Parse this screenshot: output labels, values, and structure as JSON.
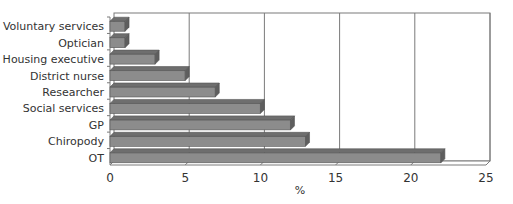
{
  "chart_data": {
    "type": "bar",
    "orientation": "horizontal",
    "style": "3d",
    "title": "",
    "xlabel": "%",
    "ylabel": "",
    "categories": [
      "Voluntary services",
      "Optician",
      "Housing executive",
      "District nurse",
      "Researcher",
      "Social services",
      "GP",
      "Chiropody",
      "OT"
    ],
    "values": [
      1,
      1,
      3,
      5,
      7,
      10,
      12,
      13,
      22
    ],
    "xlim": [
      0,
      25
    ],
    "xticks": [
      0,
      5,
      10,
      15,
      20,
      25
    ],
    "grid": "vertical",
    "legend": "none",
    "bar_color": "#8a8a8a"
  },
  "colors": {
    "bar_front": "#8c8c8c",
    "bar_top": "#6e6e6e",
    "bar_side": "#5e5e5e",
    "grid": "#7a7a7a",
    "text": "#333333"
  }
}
